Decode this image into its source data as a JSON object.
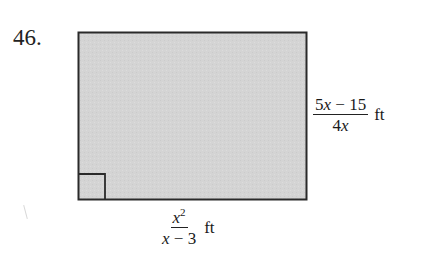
{
  "problem": {
    "number": "46."
  },
  "figure": {
    "shape": "rectangle",
    "fill_color": "#d4d4d4",
    "stroke_color": "#2a2a2a",
    "right_angle_marker": "bottom-left",
    "height_label": {
      "numerator_parts": [
        "5",
        "x",
        " − 15"
      ],
      "denominator_parts": [
        "4",
        "x"
      ],
      "unit": "ft",
      "text": "(5x − 15)/(4x) ft"
    },
    "width_label": {
      "numerator_base": "x",
      "numerator_exponent": "2",
      "denominator_parts": [
        "x",
        " − 3"
      ],
      "unit": "ft",
      "text": "x²/(x − 3) ft"
    }
  }
}
